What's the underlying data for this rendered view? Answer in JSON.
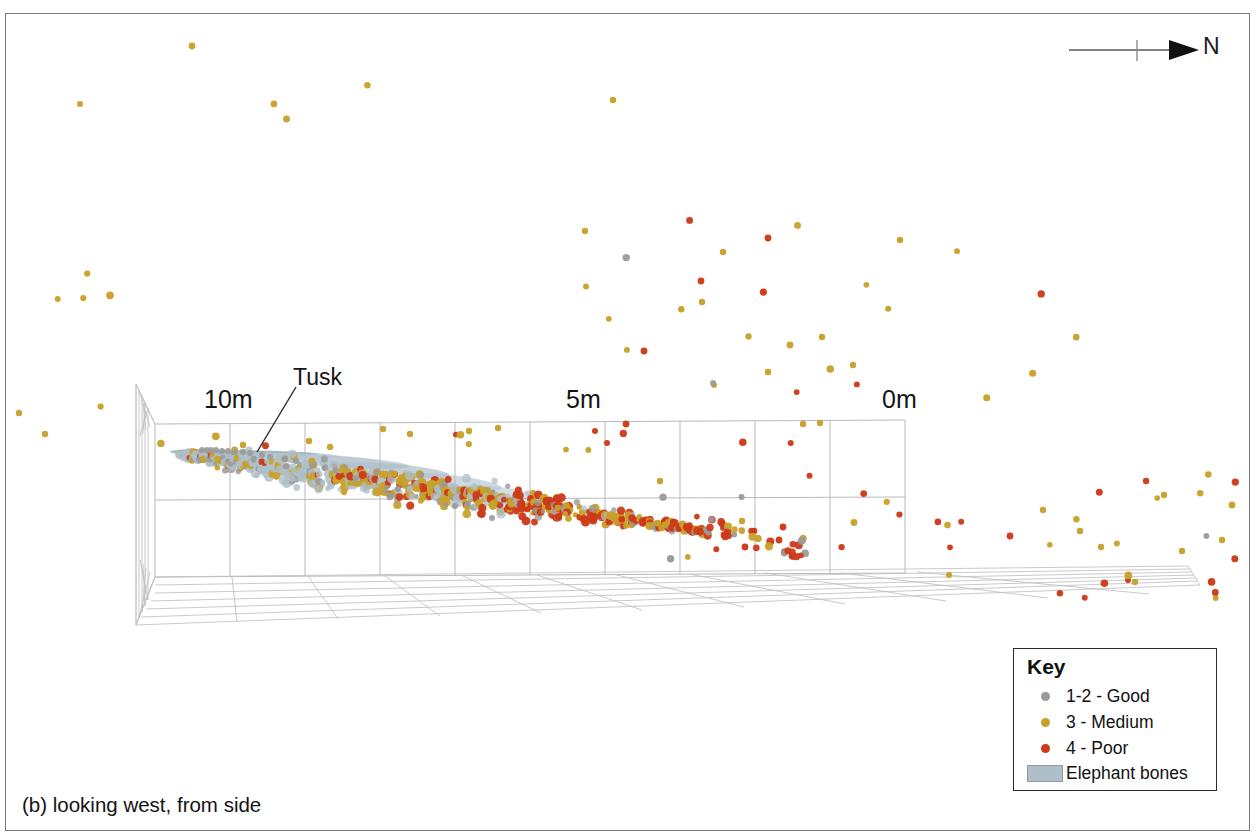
{
  "figure": {
    "caption": "(b) looking west, from side",
    "orientation_label": "N",
    "background_color": "#ffffff",
    "frame_color": "#7a7a80"
  },
  "axis": {
    "unit": "m",
    "ticks": [
      {
        "label": "10m",
        "value": 10
      },
      {
        "label": "5m",
        "value": 5
      },
      {
        "label": "0m",
        "value": 0
      }
    ]
  },
  "annotations": [
    {
      "name": "tusk",
      "label": "Tusk"
    }
  ],
  "legend": {
    "title": "Key",
    "items": [
      {
        "label": "1-2 - Good",
        "marker": "dot",
        "color": "#9a9a9a"
      },
      {
        "label": "3 - Medium",
        "marker": "dot",
        "color": "#c8a12a"
      },
      {
        "label": "4 - Poor",
        "marker": "dot",
        "color": "#cc3a18"
      },
      {
        "label": "Elephant bones",
        "marker": "rect",
        "color": "#aebfc9"
      }
    ]
  },
  "chart_data": {
    "type": "scatter",
    "title": "",
    "subtitle": "",
    "xlabel": "",
    "ylabel": "",
    "projection": "3d-perspective-box",
    "view": "looking west, from side",
    "grid": true,
    "legend_position": "bottom-right",
    "axis_tick_labels": [
      "10m",
      "5m",
      "0m"
    ],
    "axis_tick_values": [
      10,
      5,
      0
    ],
    "xlim": [
      0,
      10
    ],
    "series": [
      {
        "name": "1-2 - Good",
        "color": "#9a9a9a",
        "count_visible": 170
      },
      {
        "name": "3 - Medium",
        "color": "#c8a12a",
        "count_visible": 420
      },
      {
        "name": "4 - Poor",
        "color": "#cc3a18",
        "count_visible": 180
      },
      {
        "name": "Elephant bones",
        "color": "#aebfc9",
        "count_visible": 1
      }
    ]
  },
  "scatter_points": {
    "good": [
      [
        713,
        383,
        3.0
      ],
      [
        492,
        518,
        3.0
      ],
      [
        455,
        506,
        3.0
      ],
      [
        398,
        489,
        3.0
      ],
      [
        356,
        478,
        3.0
      ],
      [
        336,
        470,
        3.0
      ],
      [
        312,
        465,
        3.0
      ],
      [
        296,
        461,
        3.0
      ],
      [
        285,
        459,
        3.0
      ],
      [
        270,
        457,
        3.0
      ],
      [
        262,
        455,
        3.0
      ],
      [
        250,
        453,
        3.0
      ],
      [
        243,
        452,
        3.0
      ],
      [
        235,
        452,
        3.0
      ],
      [
        228,
        451,
        3.0
      ],
      [
        222,
        451,
        3.0
      ],
      [
        216,
        450,
        3.0
      ],
      [
        211,
        450,
        3.0
      ],
      [
        207,
        450,
        3.0
      ],
      [
        202,
        450,
        3.0
      ]
    ],
    "medium_outliers": [
      [
        192,
        46,
        3.4
      ],
      [
        80,
        104,
        3.0
      ],
      [
        613,
        100,
        3.2
      ],
      [
        585,
        231,
        3.2
      ],
      [
        723,
        252,
        3.2
      ],
      [
        900,
        240,
        3.2
      ],
      [
        702,
        302,
        3.2
      ],
      [
        790,
        345,
        3.4
      ],
      [
        822,
        337,
        3.2
      ],
      [
        853,
        365,
        3.2
      ],
      [
        768,
        372,
        3.2
      ],
      [
        714,
        385,
        3.0
      ],
      [
        660,
        481,
        3.2
      ],
      [
        742,
        521,
        3.2
      ],
      [
        1164,
        495,
        3.2
      ],
      [
        1222,
        540,
        3.2
      ],
      [
        1232,
        505,
        3.4
      ],
      [
        1182,
        551,
        3.2
      ],
      [
        1101,
        547,
        3.2
      ],
      [
        1135,
        582,
        3.2
      ],
      [
        45,
        434,
        3.2
      ],
      [
        19,
        413,
        3.2
      ],
      [
        243,
        445,
        3.2
      ],
      [
        309,
        441,
        3.2
      ],
      [
        383,
        429,
        3.2
      ],
      [
        410,
        434,
        3.2
      ],
      [
        469,
        431,
        3.2
      ],
      [
        498,
        428,
        3.2
      ],
      [
        803,
        424,
        3.2
      ],
      [
        820,
        423,
        3.2
      ],
      [
        1043,
        510,
        3.2
      ],
      [
        1080,
        531,
        3.2
      ],
      [
        949,
        575,
        3.0
      ]
    ],
    "poor_outliers": [
      [
        768,
        238,
        3.4
      ],
      [
        701,
        281,
        3.4
      ],
      [
        644,
        351,
        3.4
      ],
      [
        626,
        424,
        3.4
      ],
      [
        724,
        535,
        3.4
      ],
      [
        745,
        547,
        3.4
      ],
      [
        779,
        540,
        3.4
      ],
      [
        783,
        527,
        3.4
      ],
      [
        1010,
        536,
        3.4
      ],
      [
        1128,
        580,
        3.0
      ],
      [
        595,
        431,
        3.0
      ],
      [
        607,
        443,
        3.0
      ]
    ],
    "band_note": "Main dense band runs from approx (180,455) to (700,530) in figure pixel space."
  }
}
